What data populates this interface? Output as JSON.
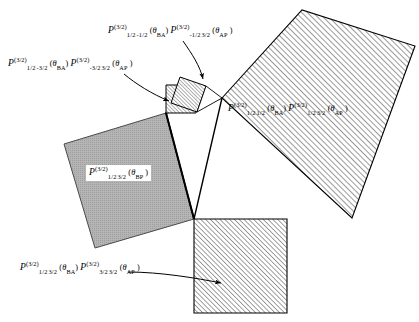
{
  "figure": {
    "background_color": "#ffffff",
    "stroke_color": "#000000",
    "gray_fill": "#b3b3b3",
    "hatch_color": "#1a1a1a"
  },
  "labels": {
    "top": {
      "name": "label-top-small-rotated-square",
      "terms": [
        {
          "symbol": "P",
          "superscript": "(3/2)",
          "sub_left": "1/2",
          "sub_right": "-1/2",
          "argument": "θ",
          "argument_subscript": "BA"
        },
        {
          "symbol": "P",
          "superscript": "(3/2)",
          "sub_left": "-1/2",
          "sub_right": "3/2",
          "argument": "θ",
          "argument_subscript": "AP"
        }
      ],
      "plain_text": "P (3/2) 1/2 -1/2 (θBA) P (3/2) -1/2 3/2 (θAP)"
    },
    "left": {
      "name": "label-left-small-axis-square",
      "terms": [
        {
          "symbol": "P",
          "superscript": "(3/2)",
          "sub_left": "1/2",
          "sub_right": "-3/2",
          "argument": "θ",
          "argument_subscript": "BA"
        },
        {
          "symbol": "P",
          "superscript": "(3/2)",
          "sub_left": "-3/2",
          "sub_right": "3/2",
          "argument": "θ",
          "argument_subscript": "AP"
        }
      ],
      "plain_text": "P (3/2) 1/2 -3/2 (θBA) P (3/2) -3/2 3/2 (θAP)"
    },
    "right": {
      "name": "label-large-hatched-square",
      "terms": [
        {
          "symbol": "P",
          "superscript": "(3/2)",
          "sub_left": "1/2",
          "sub_right": "1/2",
          "argument": "θ",
          "argument_subscript": "BA"
        },
        {
          "symbol": "P",
          "superscript": "(3/2)",
          "sub_left": "1/2",
          "sub_right": "3/2",
          "argument": "θ",
          "argument_subscript": "AP"
        }
      ],
      "plain_text": "P (3/2) 1/2 1/2 (θBA) P (3/2) 1/2 3/2 (θAP)"
    },
    "gray": {
      "name": "label-gray-square",
      "terms": [
        {
          "symbol": "P",
          "superscript": "(3/2)",
          "sub_left": "1/2",
          "sub_right": "3/2",
          "argument": "θ",
          "argument_subscript": "BP"
        }
      ],
      "plain_text": "P (3/2) 1/2 3/2 (θBP)"
    },
    "bottom": {
      "name": "label-bottom-hatched-square",
      "terms": [
        {
          "symbol": "P",
          "superscript": "(3/2)",
          "sub_left": "1/2",
          "sub_right": "3/2",
          "argument": "θ",
          "argument_subscript": "BA"
        },
        {
          "symbol": "P",
          "superscript": "(3/2)",
          "sub_left": "3/2",
          "sub_right": "3/2",
          "argument": "θ",
          "argument_subscript": "AP"
        }
      ],
      "plain_text": "P (3/2) 1/2 3/2 (θBA) P (3/2) 3/2 3/2 (θAP)"
    }
  },
  "shapes": [
    {
      "name": "large-hatched-square",
      "fill": "hatch",
      "points": "222,98 302,10 415,46 352,218"
    },
    {
      "name": "gray-square",
      "fill": "solid-gray",
      "points": "166,113 64,144 95,248 194,219"
    },
    {
      "name": "bottom-hatched-square",
      "fill": "hatch",
      "points": "194,219 287,219 287,313 194,313"
    },
    {
      "name": "small-axis-square",
      "fill": "hatch",
      "points": "166,85 196,85 196,113 166,113"
    },
    {
      "name": "small-rotated-square",
      "fill": "hatch",
      "points": "179,78 205,86 197,112 171,104"
    },
    {
      "name": "central-white-triangle",
      "fill": "white",
      "points": "166,113 222,98 194,219"
    }
  ],
  "arrows": [
    {
      "name": "arrow-to-rotated-square",
      "from": "186,42",
      "to": "203,80"
    },
    {
      "name": "arrow-to-axis-square",
      "from": "126,76",
      "to": "170,100"
    },
    {
      "name": "arrow-to-bottom-square",
      "from": "128,273",
      "to": "222,283"
    }
  ]
}
